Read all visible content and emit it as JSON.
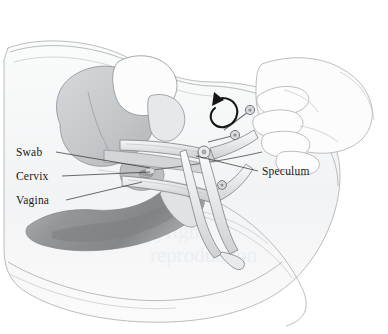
{
  "figure": {
    "kind": "medical-line-illustration",
    "width": 388,
    "height": 334,
    "background_color": "#ffffff"
  },
  "palette": {
    "background": "#ffffff",
    "body_fill": "#f4f5f6",
    "body_outline": "#a9abad",
    "organ_light": "#e3e5e7",
    "organ_mid": "#c8cbcd",
    "organ_dark": "#9b9ea1",
    "rectum_dark": "#8b8e91",
    "instrument_fill": "#eef0f1",
    "instrument_outline": "#7e8184",
    "label_text": "#1a1a1a",
    "leader_line": "#2b2b2b",
    "watermark": "#eceef0"
  },
  "labels": [
    {
      "id": "swab",
      "text": "Swab",
      "side": "left",
      "text_x": 16,
      "text_y": 156,
      "leader": {
        "x1": 56,
        "y1": 152,
        "x2": 150,
        "y2": 168
      }
    },
    {
      "id": "cervix",
      "text": "Cervix",
      "side": "left",
      "text_x": 16,
      "text_y": 180,
      "leader": {
        "x1": 62,
        "y1": 176,
        "x2": 150,
        "y2": 172
      }
    },
    {
      "id": "vagina",
      "text": "Vagina",
      "side": "left",
      "text_x": 16,
      "text_y": 204,
      "leader": {
        "x1": 66,
        "y1": 200,
        "x2": 142,
        "y2": 182
      }
    },
    {
      "id": "speculum",
      "text": "Speculum",
      "side": "right",
      "text_x": 262,
      "text_y": 175,
      "leader": {
        "x1": 258,
        "y1": 171,
        "x2": 196,
        "y2": 156
      }
    }
  ],
  "annotations": {
    "rotation_arrow": {
      "name": "thumbscrew-rotation-arrow",
      "meaning": "rotate thumbscrew",
      "center_x": 225,
      "center_y": 108
    }
  },
  "watermark": {
    "line1": "Copyright",
    "line2": "reproduction"
  }
}
